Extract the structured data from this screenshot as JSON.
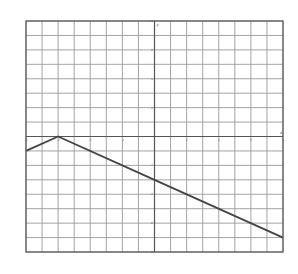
{
  "chart_data": {
    "type": "line",
    "title": "",
    "xlabel": "x",
    "ylabel": "y",
    "xlim": [
      -8,
      8
    ],
    "ylim": [
      -8,
      8
    ],
    "grid": true,
    "grid_step": 1,
    "tick_step": 2,
    "x_ticks": [
      -8,
      -6,
      -4,
      -2,
      2,
      4,
      6,
      8
    ],
    "y_ticks": [
      -8,
      -6,
      -4,
      -2,
      2,
      4,
      6,
      8
    ],
    "legend": null,
    "series": [
      {
        "name": "y = -1/2|x + 6|",
        "points": [
          [
            -8,
            -1
          ],
          [
            -6,
            0
          ],
          [
            0,
            -3
          ],
          [
            8,
            -7
          ]
        ],
        "color": "#444444"
      }
    ]
  },
  "layout": {
    "plot_left": 26,
    "plot_top": 21,
    "plot_right": 283,
    "plot_bottom": 252,
    "grid_color": "#9a9a9a",
    "axis_color": "#555555",
    "frame_color": "#555555"
  }
}
